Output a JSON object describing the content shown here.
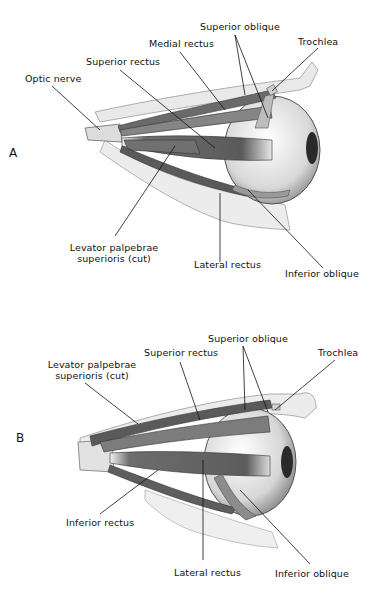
{
  "figures": [
    {
      "id": "A",
      "panel_letter": "A",
      "labels": {
        "optic_nerve": "Optic nerve",
        "superior_rectus": "Superior rectus",
        "medial_rectus": "Medial rectus",
        "superior_oblique": "Superior oblique",
        "trochlea": "Trochlea",
        "levator_line1": "Levator palpebrae",
        "levator_line2": "superioris (cut)",
        "lateral_rectus": "Lateral rectus",
        "inferior_oblique": "Inferior oblique"
      }
    },
    {
      "id": "B",
      "panel_letter": "B",
      "labels": {
        "levator_line1": "Levator palpebrae",
        "levator_line2": "superioris (cut)",
        "superior_rectus": "Superior rectus",
        "superior_oblique": "Superior oblique",
        "trochlea": "Trochlea",
        "inferior_rectus": "Inferior rectus",
        "lateral_rectus": "Lateral rectus",
        "inferior_oblique": "Inferior oblique"
      }
    }
  ],
  "colors": {
    "muscle": "#7a7a7a",
    "muscle_dark": "#4a4a4a",
    "bone": "#e6e6e6",
    "globe": "#dcdcdc",
    "leader_line": "#111111"
  }
}
